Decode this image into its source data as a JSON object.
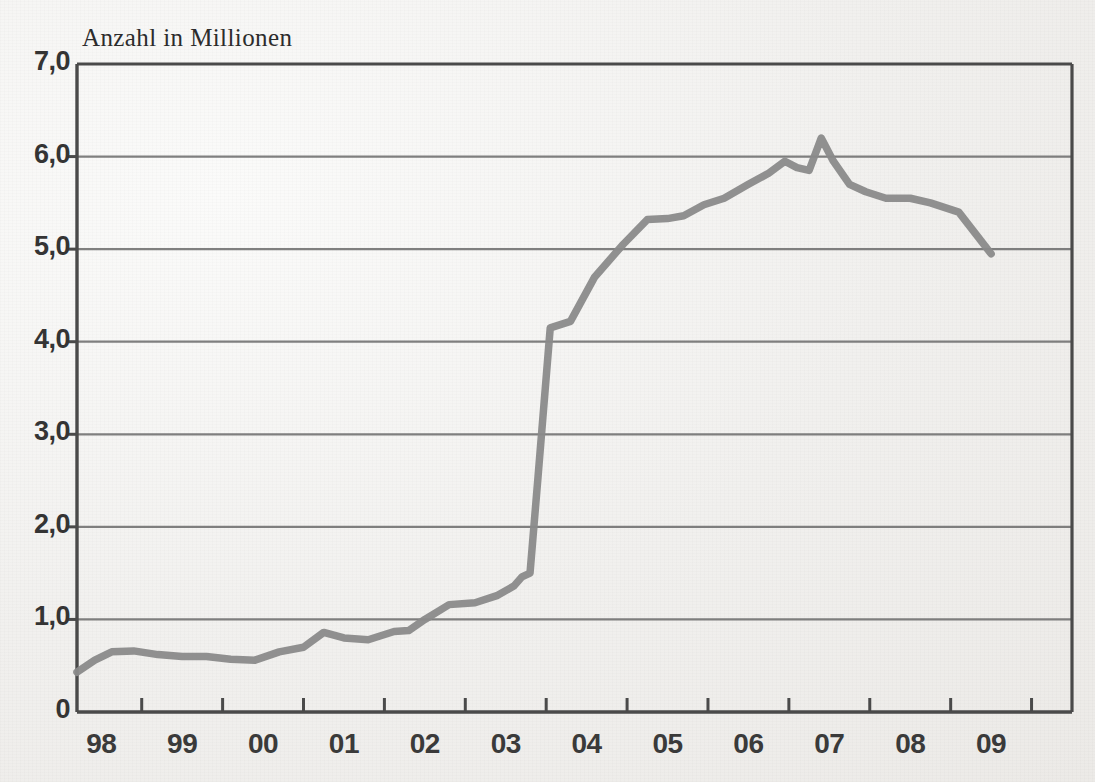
{
  "chart_data": {
    "type": "line",
    "title": "Anzahl in Millionen",
    "subtitle": "",
    "xlabel": "",
    "ylabel": "Anzahl in Millionen",
    "ylim": [
      0,
      7
    ],
    "xlim": [
      1997.7,
      2010.0
    ],
    "grid": true,
    "legend": false,
    "legend_position": "none",
    "y_ticks": [
      0,
      1,
      2,
      3,
      4,
      5,
      6,
      7
    ],
    "y_tick_labels": [
      "0",
      "1,0",
      "2,0",
      "3,0",
      "4,0",
      "5,0",
      "6,0",
      "7,0"
    ],
    "x_tick_labels": [
      "98",
      "99",
      "00",
      "01",
      "02",
      "03",
      "04",
      "05",
      "06",
      "07",
      "08",
      "09"
    ],
    "x_tick_values": [
      1998,
      1999,
      2000,
      2001,
      2002,
      2003,
      2004,
      2005,
      2006,
      2007,
      2008,
      2009
    ],
    "line_color": "#8a8a8a",
    "axis_color": "#4a4a4a",
    "grid_color": "#6b6b6b",
    "series": [
      {
        "name": "Anzahl in Millionen",
        "x": [
          1997.7,
          1997.92,
          1998.13,
          1998.4,
          1998.7,
          1999.0,
          1999.3,
          1999.6,
          1999.9,
          2000.2,
          2000.5,
          2000.75,
          2001.0,
          2001.3,
          2001.62,
          2001.8,
          2002.0,
          2002.3,
          2002.62,
          2002.9,
          2003.1,
          2003.2,
          2003.3,
          2003.4,
          2003.55,
          2003.8,
          2004.1,
          2004.45,
          2004.75,
          2005.0,
          2005.2,
          2005.45,
          2005.7,
          2006.0,
          2006.25,
          2006.45,
          2006.6,
          2006.75,
          2006.9,
          2007.05,
          2007.25,
          2007.45,
          2007.7,
          2008.0,
          2008.25,
          2008.6,
          2009.0
        ],
        "y": [
          0.43,
          0.56,
          0.65,
          0.66,
          0.62,
          0.6,
          0.6,
          0.57,
          0.56,
          0.65,
          0.7,
          0.86,
          0.8,
          0.78,
          0.87,
          0.88,
          1.0,
          1.16,
          1.18,
          1.26,
          1.36,
          1.46,
          1.5,
          2.55,
          4.15,
          4.22,
          4.7,
          5.05,
          5.32,
          5.33,
          5.36,
          5.48,
          5.55,
          5.7,
          5.82,
          5.95,
          5.88,
          5.85,
          6.2,
          5.95,
          5.7,
          5.62,
          5.55,
          5.55,
          5.5,
          5.4,
          4.95
        ]
      }
    ]
  },
  "title": {
    "text": "Anzahl in Millionen"
  }
}
